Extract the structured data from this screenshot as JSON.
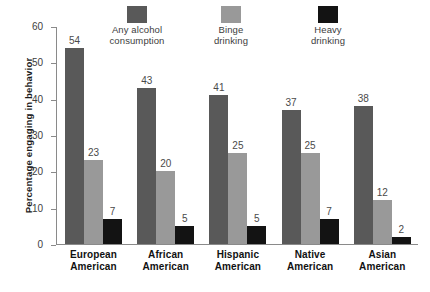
{
  "chart_data": {
    "type": "bar",
    "title": "",
    "xlabel": "",
    "ylabel": "Percentage engaging in behavior",
    "ylim": [
      0,
      60
    ],
    "yticks": [
      0,
      10,
      20,
      30,
      40,
      50,
      60
    ],
    "grid": false,
    "legend_position": "top",
    "categories": [
      "European\nAmerican",
      "African\nAmerican",
      "Hispanic\nAmerican",
      "Native\nAmerican",
      "Asian\nAmerican"
    ],
    "series": [
      {
        "name": "Any alcohol\nconsumption",
        "color": "#595959",
        "values": [
          54,
          43,
          41,
          37,
          38
        ]
      },
      {
        "name": "Binge\ndrinking",
        "color": "#999999",
        "values": [
          23,
          20,
          25,
          25,
          12
        ]
      },
      {
        "name": "Heavy\ndrinking",
        "color": "#131313",
        "values": [
          7,
          5,
          5,
          7,
          2
        ]
      }
    ]
  },
  "axis": {
    "line_color": "#8a8a8a"
  },
  "footer": {
    "clipped_caption": ""
  }
}
